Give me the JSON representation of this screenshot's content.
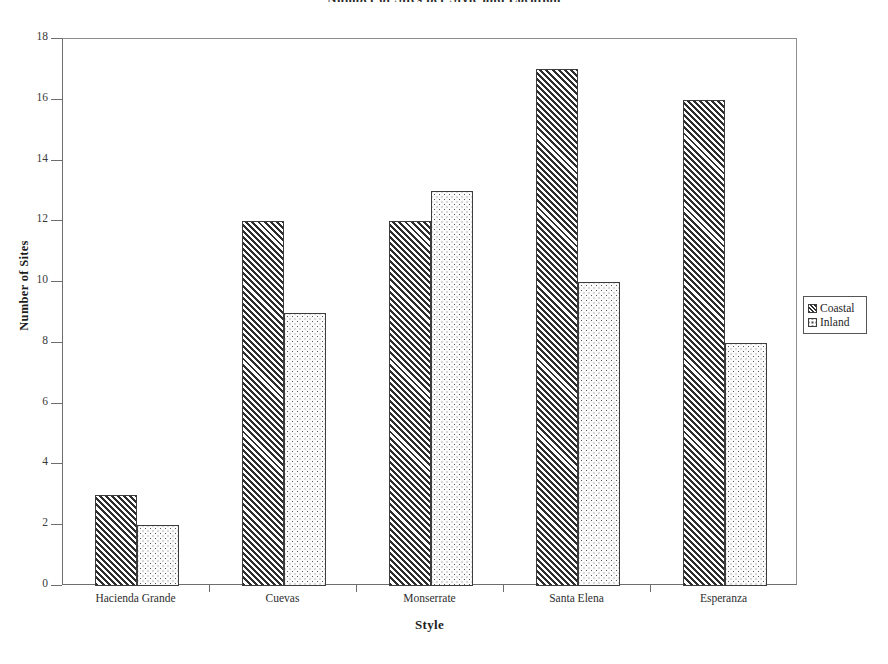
{
  "chart_data": {
    "type": "bar",
    "title": "Number of Sites per Style and Location",
    "xlabel": "Style",
    "ylabel": "Number of Sites",
    "categories": [
      "Hacienda Grande",
      "Cuevas",
      "Monserrate",
      "Santa Elena",
      "Esperanza"
    ],
    "series": [
      {
        "name": "Coastal",
        "values": [
          3,
          12,
          12,
          17,
          16
        ],
        "pattern": "diagonal-hatch",
        "color": "#2e2e2e"
      },
      {
        "name": "Inland",
        "values": [
          2,
          9,
          13,
          10,
          8
        ],
        "pattern": "stipple-dots",
        "color": "#f0f0f0"
      }
    ],
    "ylim": [
      0,
      18
    ],
    "yticks": [
      0,
      2,
      4,
      6,
      8,
      10,
      12,
      14,
      16,
      18
    ],
    "ytick_labels": [
      "0",
      "2",
      "4",
      "6",
      "8",
      "10",
      "12",
      "14",
      "16",
      "18"
    ],
    "grid": false,
    "legend_position": "right",
    "legend_entries": [
      "Coastal",
      "Inland"
    ]
  },
  "figure": {
    "background_color": "#ffffff",
    "frame_color": "#6d6d6d",
    "text_color": "#1d1d1d"
  }
}
